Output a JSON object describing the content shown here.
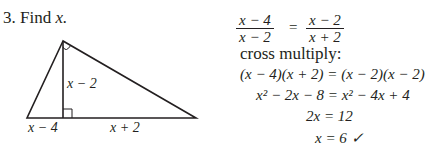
{
  "problem": {
    "number": "3.",
    "prompt_prefix": "Find",
    "prompt_var": "x."
  },
  "figure": {
    "type": "right-triangle-with-altitude",
    "labels": {
      "altitude": "x − 2",
      "left_segment": "x − 4",
      "right_segment": "x + 2"
    },
    "markers": [
      "right-angle-at-apex",
      "right-angle-at-altitude-foot"
    ]
  },
  "solution": {
    "proportion": {
      "left_num": "x − 4",
      "left_den": "x − 2",
      "equals": "=",
      "right_num": "x − 2",
      "right_den": "x + 2"
    },
    "step_label": "cross multiply:",
    "lines": [
      "(x − 4)(x + 2) = (x − 2)(x − 2)",
      "x² − 2x − 8 = x² − 4x + 4",
      "2x = 12",
      "x = 6 ✓"
    ]
  }
}
